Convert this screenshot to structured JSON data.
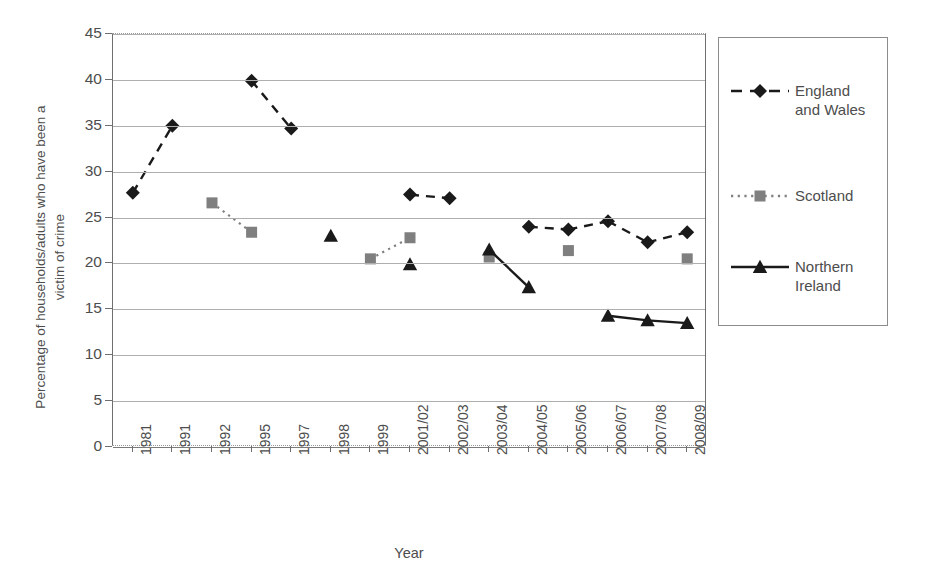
{
  "chart_data": {
    "type": "line",
    "title": "",
    "xlabel": "Year",
    "ylabel": "Percentage of households/adults who have been a\nvictim of crime",
    "categories": [
      "1981",
      "1991",
      "1992",
      "1995",
      "1997",
      "1998",
      "1999",
      "2001/02",
      "2002/03",
      "2003/04",
      "2004/05",
      "2005/06",
      "2006/07",
      "2007/08",
      "2008/09"
    ],
    "ylim": [
      0,
      45
    ],
    "yticks": [
      0,
      5,
      10,
      15,
      20,
      25,
      30,
      35,
      40,
      45
    ],
    "grid": true,
    "legend_position": "right",
    "series": [
      {
        "name": "England\nand Wales",
        "marker": "diamond",
        "linestyle": "dashed",
        "color": "#1a1a1a",
        "values": [
          27.7,
          35.0,
          null,
          39.9,
          34.7,
          null,
          null,
          27.5,
          27.1,
          null,
          24.0,
          23.7,
          24.6,
          22.3,
          23.4
        ]
      },
      {
        "name": "Scotland",
        "marker": "square",
        "linestyle": "dotted",
        "color": "#7f7f7f",
        "values": [
          null,
          null,
          26.6,
          23.4,
          null,
          null,
          20.5,
          22.8,
          null,
          20.7,
          null,
          21.4,
          null,
          null,
          20.5
        ]
      },
      {
        "name": "Northern\nIreland",
        "marker": "triangle",
        "linestyle": "solid",
        "color": "#1a1a1a",
        "values": [
          null,
          null,
          null,
          null,
          null,
          23.0,
          null,
          19.9,
          null,
          21.5,
          17.4,
          null,
          14.3,
          13.8,
          13.5
        ]
      }
    ]
  },
  "axes": {
    "y_tick_labels": [
      "0",
      "5",
      "10",
      "15",
      "20",
      "25",
      "30",
      "35",
      "40",
      "45"
    ],
    "x_tick_labels": [
      "1981",
      "1991",
      "1992",
      "1995",
      "1997",
      "1998",
      "1999",
      "2001/02",
      "2002/03",
      "2003/04",
      "2004/05",
      "2005/06",
      "2006/07",
      "2007/08",
      "2008/09"
    ],
    "x_axis_title": "Year",
    "y_axis_title": "Percentage of households/adults who have been a\nvictim of crime"
  },
  "legend": {
    "items": [
      {
        "label": "England\nand Wales",
        "marker": "diamond-marker-icon",
        "color": "#1a1a1a"
      },
      {
        "label": "Scotland",
        "marker": "square-marker-icon",
        "color": "#7f7f7f"
      },
      {
        "label": "Northern\nIreland",
        "marker": "triangle-marker-icon",
        "color": "#1a1a1a"
      }
    ]
  }
}
